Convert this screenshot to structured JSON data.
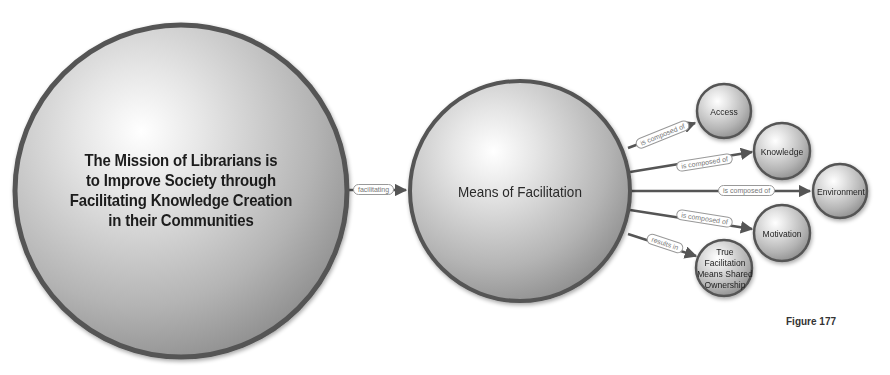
{
  "nodes": {
    "mission": "The Mission of Librarians is to Improve Society through Facilitating Knowledge Creation in their Communities",
    "mission_lines": [
      "The Mission of Librarians is",
      "to Improve Society through",
      "Facilitating Knowledge Creation",
      "in their Communities"
    ],
    "means": "Means of Facilitation",
    "access": "Access",
    "knowledge": "Knowledge",
    "environment": "Environment",
    "motivation": "Motivation",
    "true_facilitation_lines": [
      "True",
      "Facilitation",
      "Means Shared",
      "Ownership"
    ]
  },
  "edges": {
    "facilitating": "facilitating",
    "access": "is composed of",
    "knowledge": "is composed of",
    "environment": "is composed of",
    "motivation": "is composed of",
    "results": "results in"
  },
  "caption": "Figure 177",
  "colors": {
    "node_border": "#555555",
    "node_fill_light": "#f4f4f4",
    "node_fill_dark": "#8e8e8e",
    "edge": "#555555"
  }
}
